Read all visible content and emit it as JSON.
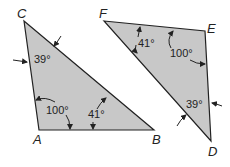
{
  "diagram": {
    "fill_color": "#c8c8c8",
    "stroke_color": "#222222",
    "triangle_abc": {
      "vertices": {
        "C": "C",
        "A": "A",
        "B": "B"
      },
      "angles": {
        "C": "39°",
        "A": "100°",
        "B": "41°"
      }
    },
    "triangle_fed": {
      "vertices": {
        "F": "F",
        "E": "E",
        "D": "D"
      },
      "angles": {
        "F": "41°",
        "E": "100°",
        "D": "39°"
      }
    }
  }
}
